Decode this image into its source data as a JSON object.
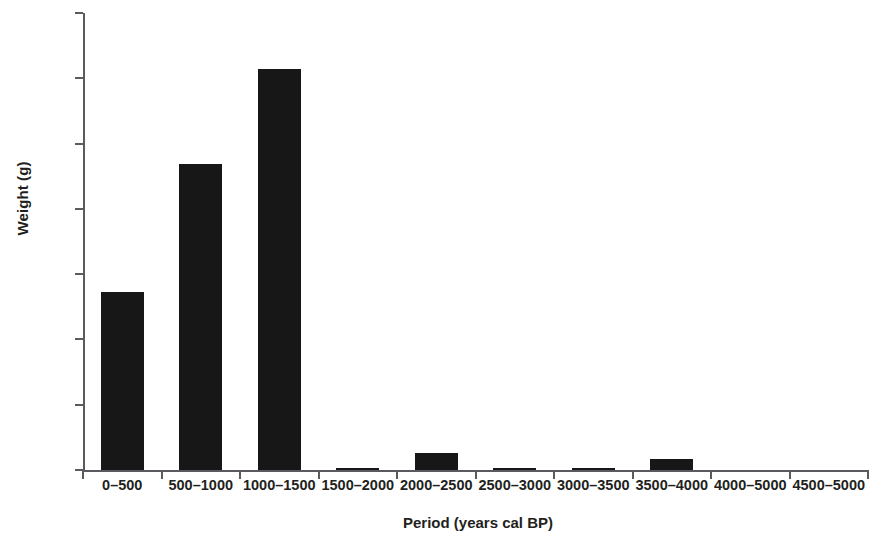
{
  "chart_data": {
    "type": "bar",
    "title": "",
    "xlabel": "Period (years cal BP)",
    "ylabel": "Weight (g)",
    "categories": [
      "0–500",
      "500–1000",
      "1000–1500",
      "1500–2000",
      "2000–2500",
      "2500–3000",
      "3000–3500",
      "3500–4000",
      "4000–5000",
      "4500–5000"
    ],
    "values": [
      2720,
      4690,
      6140,
      25,
      255,
      20,
      25,
      170,
      0,
      0
    ],
    "ylim": [
      0,
      7000
    ],
    "ytick_labels": [
      "0",
      "1000",
      "2000",
      "3000",
      "4000",
      "5000",
      "6000",
      "7000"
    ],
    "ytick_values": [
      0,
      1000,
      2000,
      3000,
      4000,
      5000,
      6000,
      7000
    ],
    "grid": false,
    "legend": false,
    "bar_color": "#171717",
    "axis_color": "#5b5b5f"
  }
}
